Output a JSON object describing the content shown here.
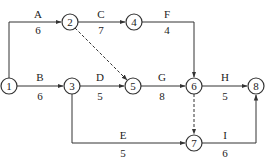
{
  "nodes": [
    {
      "id": "1",
      "label": "1",
      "x": 9,
      "y": 86
    },
    {
      "id": "2",
      "label": "2",
      "x": 70,
      "y": 22
    },
    {
      "id": "3",
      "label": "3",
      "x": 72,
      "y": 86
    },
    {
      "id": "4",
      "label": "4",
      "x": 134,
      "y": 22
    },
    {
      "id": "5",
      "label": "5",
      "x": 133,
      "y": 86
    },
    {
      "id": "6",
      "label": "6",
      "x": 194,
      "y": 86
    },
    {
      "id": "7",
      "label": "7",
      "x": 194,
      "y": 143
    },
    {
      "id": "8",
      "label": "8",
      "x": 256,
      "y": 86
    }
  ],
  "activities": [
    {
      "name": "A",
      "duration": "6",
      "from": "1",
      "to": "2"
    },
    {
      "name": "B",
      "duration": "6",
      "from": "1",
      "to": "3"
    },
    {
      "name": "C",
      "duration": "7",
      "from": "2",
      "to": "4"
    },
    {
      "name": "D",
      "duration": "5",
      "from": "3",
      "to": "5"
    },
    {
      "name": "E",
      "duration": "5",
      "from": "3",
      "to": "7"
    },
    {
      "name": "F",
      "duration": "4",
      "from": "4",
      "to": "6"
    },
    {
      "name": "G",
      "duration": "8",
      "from": "5",
      "to": "6"
    },
    {
      "name": "H",
      "duration": "5",
      "from": "6",
      "to": "8"
    },
    {
      "name": "I",
      "duration": "6",
      "from": "7",
      "to": "8"
    }
  ],
  "dummies": [
    {
      "from": "2",
      "to": "5"
    },
    {
      "from": "6",
      "to": "7"
    }
  ],
  "colors": {
    "line": "#333333",
    "text": "#222222"
  }
}
